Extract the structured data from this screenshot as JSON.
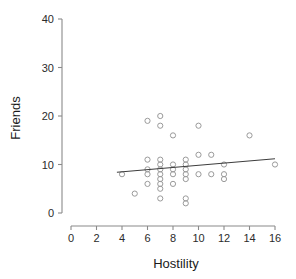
{
  "chart_data": {
    "type": "scatter",
    "title": "",
    "xlabel": "Hostility",
    "ylabel": "Friends",
    "xlim": [
      0,
      16
    ],
    "ylim": [
      0,
      40
    ],
    "xticks": [
      0,
      2,
      4,
      6,
      8,
      10,
      12,
      14,
      16
    ],
    "yticks": [
      0,
      10,
      20,
      30,
      40
    ],
    "xtick_labels": [
      "0",
      "2",
      "4",
      "6",
      "8",
      "10",
      "12",
      "14",
      "16"
    ],
    "ytick_labels": [
      "0",
      "10",
      "20",
      "30",
      "40"
    ],
    "grid": false,
    "legend": false,
    "marker_style": "open-circle",
    "marker_color": "#9a9a9a",
    "line_color": "#3d3d3d",
    "points": [
      {
        "x": 4,
        "y": 8
      },
      {
        "x": 5,
        "y": 4
      },
      {
        "x": 6,
        "y": 19
      },
      {
        "x": 6,
        "y": 11
      },
      {
        "x": 6,
        "y": 9
      },
      {
        "x": 6,
        "y": 8
      },
      {
        "x": 6,
        "y": 6
      },
      {
        "x": 7,
        "y": 20
      },
      {
        "x": 7,
        "y": 18
      },
      {
        "x": 7,
        "y": 11
      },
      {
        "x": 7,
        "y": 10
      },
      {
        "x": 7,
        "y": 9
      },
      {
        "x": 7,
        "y": 8
      },
      {
        "x": 7,
        "y": 7
      },
      {
        "x": 7,
        "y": 6
      },
      {
        "x": 7,
        "y": 5
      },
      {
        "x": 7,
        "y": 3
      },
      {
        "x": 8,
        "y": 16
      },
      {
        "x": 8,
        "y": 10
      },
      {
        "x": 8,
        "y": 9
      },
      {
        "x": 8,
        "y": 8
      },
      {
        "x": 8,
        "y": 6
      },
      {
        "x": 9,
        "y": 11
      },
      {
        "x": 9,
        "y": 10
      },
      {
        "x": 9,
        "y": 9
      },
      {
        "x": 9,
        "y": 8
      },
      {
        "x": 9,
        "y": 7
      },
      {
        "x": 9,
        "y": 3
      },
      {
        "x": 9,
        "y": 2
      },
      {
        "x": 10,
        "y": 18
      },
      {
        "x": 10,
        "y": 12
      },
      {
        "x": 10,
        "y": 8
      },
      {
        "x": 11,
        "y": 12
      },
      {
        "x": 11,
        "y": 8
      },
      {
        "x": 12,
        "y": 10
      },
      {
        "x": 12,
        "y": 8
      },
      {
        "x": 12,
        "y": 7
      },
      {
        "x": 14,
        "y": 16
      },
      {
        "x": 16,
        "y": 10
      }
    ],
    "fit_line": {
      "x1": 3.6,
      "y1": 8.4,
      "x2": 16.0,
      "y2": 11.2,
      "label": "regression-line"
    }
  }
}
